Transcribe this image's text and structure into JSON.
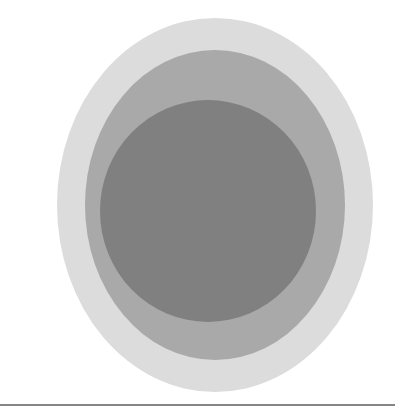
{
  "figure": {
    "title": "Concentric circles diagram",
    "background_color": "#ffffff",
    "width": 412,
    "height": 417
  },
  "chart_data": {
    "type": "pie",
    "title": "Concentric circles diagram",
    "subtitle": "",
    "xlabel": "",
    "ylabel": "",
    "legend_position": "none",
    "grid": false,
    "categories": [
      "outer-ring",
      "middle-ring",
      "inner-core"
    ],
    "values": [
      158,
      130,
      108
    ],
    "series": [
      {
        "name": "radius_px",
        "values": [
          158,
          130,
          108
        ]
      }
    ],
    "annotations": []
  },
  "rings": [
    {
      "name": "outer-ring",
      "label": "Outer ring",
      "color": "#dcdcdc",
      "center_x": 215,
      "center_y": 205,
      "radius_x": 158,
      "radius_y": 187
    },
    {
      "name": "middle-ring",
      "label": "Middle ring",
      "color": "#a9a9a9",
      "center_x": 215,
      "center_y": 205,
      "radius_x": 130,
      "radius_y": 155
    },
    {
      "name": "inner-core",
      "label": "Inner core",
      "color": "#808080",
      "center_x": 208,
      "center_y": 211,
      "radius_x": 108,
      "radius_y": 111
    }
  ],
  "divider": {
    "name": "divider-rule",
    "label": "Horizontal divider",
    "color": "#858585",
    "x": 0,
    "y": 404,
    "width": 395,
    "thickness": 2
  }
}
